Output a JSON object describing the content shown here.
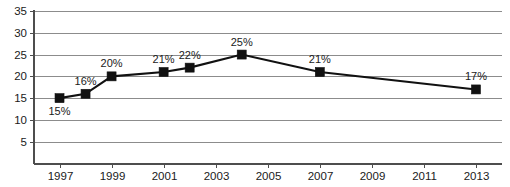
{
  "chart_data": {
    "type": "line",
    "title": "",
    "subtitle": "",
    "xlabel": "",
    "ylabel": "",
    "grid": true,
    "legend": false,
    "legend_position": "none",
    "xlim": [
      1996,
      2014
    ],
    "ylim": [
      0,
      35
    ],
    "x_tick_labels": [
      "1997",
      "1999",
      "2001",
      "2003",
      "2005",
      "2007",
      "2009",
      "2011",
      "2013"
    ],
    "x_ticks": [
      1997,
      1999,
      2001,
      2003,
      2005,
      2007,
      2009,
      2011,
      2013
    ],
    "y_tick_labels": [
      "5",
      "10",
      "15",
      "20",
      "25",
      "30",
      "35"
    ],
    "y_ticks": [
      5,
      10,
      15,
      20,
      25,
      30,
      35
    ],
    "x": [
      1997,
      1998,
      1999,
      2001,
      2002,
      2004,
      2007,
      2013
    ],
    "values": [
      15,
      16,
      20,
      21,
      22,
      25,
      21,
      17
    ],
    "point_labels": [
      "15%",
      "16%",
      "20%",
      "21%",
      "22%",
      "25%",
      "21%",
      "17%"
    ],
    "label_positions": [
      "below",
      "above",
      "above",
      "above",
      "above",
      "above",
      "above",
      "above"
    ],
    "series": [
      {
        "name": "",
        "x": [
          1997,
          1998,
          1999,
          2001,
          2002,
          2004,
          2007,
          2013
        ],
        "values": [
          15,
          16,
          20,
          21,
          22,
          25,
          21,
          17
        ],
        "marker": "square",
        "color": "#111111"
      }
    ],
    "colors": {
      "line": "#111111",
      "marker": "#111111",
      "grid": "#8c8c8c",
      "axis": "#4d4d4d",
      "text": "#1a1a1a",
      "background": "#ffffff"
    }
  }
}
